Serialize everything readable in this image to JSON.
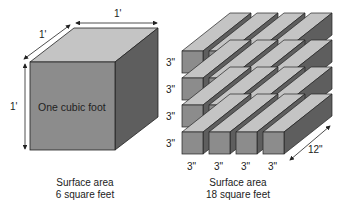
{
  "left": {
    "width_label": "1'",
    "depth_label": "1'",
    "height_label": "1'",
    "face_label": "One cubic foot",
    "caption_line1": "Surface area",
    "caption_line2": "6 square feet"
  },
  "right": {
    "row_labels": [
      "3\"",
      "3\"",
      "3\"",
      "3\""
    ],
    "col_labels": [
      "3\"",
      "3\"",
      "3\"",
      "3\""
    ],
    "length_label": "12\"",
    "caption_line1": "Surface area",
    "caption_line2": "18 square feet"
  },
  "colors": {
    "front": "#8c8c8c",
    "top": "#c4c4c4",
    "side": "#5e5e5e",
    "outline": "#222222"
  }
}
